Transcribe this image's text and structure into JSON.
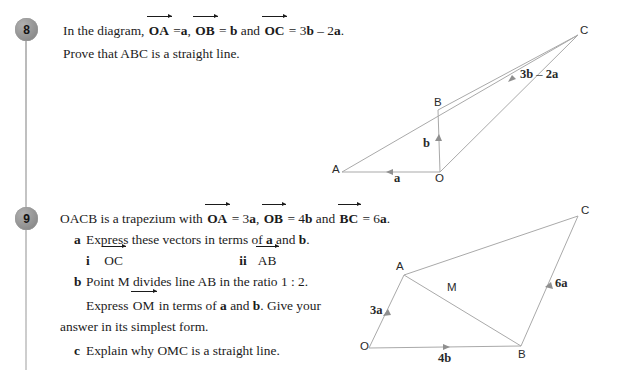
{
  "page": {
    "background": "#ffffff",
    "line_color": "#a9a9a9",
    "text_color": "#1b1b1b",
    "badge_color": "#8d8d8d"
  },
  "questions": [
    {
      "number": "8",
      "lines": [
        {
          "parts": [
            "In the diagram, ",
            "OA",
            " = ",
            "a",
            ", ",
            "OB",
            " = ",
            "b",
            " and ",
            "OC",
            " = 3",
            "b",
            " – 2",
            "a",
            "."
          ]
        },
        {
          "text": "Prove that ABC is a straight line."
        }
      ],
      "text": {
        "intro": "In the diagram,",
        "oa": "OA",
        "eq": "=",
        "a": "a",
        "comma": ",",
        "ob": "OB",
        "b": "b",
        "and": "and",
        "oc": "OC",
        "oc_value_1": "= 3",
        "oc_value_b": "b",
        "oc_value_minus": "– 2",
        "oc_value_a": "a",
        "period": ".",
        "prove": "Prove that ABC is a straight line."
      }
    },
    {
      "number": "9",
      "text": {
        "intro": "OACB is a trapezium with",
        "oa": "OA",
        "oa_value_num": "= 3",
        "oa_value_vec": "a",
        "comma": ",",
        "ob": "OB",
        "ob_value_num": "= 4",
        "ob_value_vec": "b",
        "and": "and",
        "bc": "BC",
        "bc_value_num": "= 6",
        "bc_value_vec": "a",
        "period": ".",
        "part_a_label": "a",
        "part_a": "Express these vectors in terms of a and b.",
        "part_a_pre": "Express these vectors in terms of",
        "part_a_mid": "and",
        "part_a_end": ".",
        "a_vec": "a",
        "b_vec": "b",
        "roman_i": "i",
        "item_i": "OC",
        "roman_ii": "ii",
        "item_ii": "AB",
        "part_b_label": "b",
        "part_b": "Point M divides line AB in the ratio 1 : 2.",
        "part_b_line2_pre": "Express",
        "part_b_om": "OM",
        "part_b_line2_mid": "in terms of",
        "part_b_line2_and": "and",
        "part_b_line2_tail": ". Give your",
        "part_b_line3": "answer in its simplest form.",
        "part_c_label": "c",
        "part_c": "Explain why OMC is a straight line."
      }
    }
  ],
  "diagram8": {
    "name": "vector-diagram-question-8",
    "points": {
      "A": "A",
      "O": "O",
      "B": "B",
      "C": "C"
    },
    "edge_labels": {
      "a": "a",
      "b": "b",
      "bc": "3b – 2a"
    },
    "bc_label_parts": {
      "three": "3",
      "b": "b",
      "minus": "–",
      "two": "2",
      "a": "a"
    }
  },
  "diagram9": {
    "name": "vector-diagram-question-9",
    "points": {
      "O": "O",
      "A": "A",
      "B": "B",
      "C": "C",
      "M": "M"
    },
    "edge_labels": {
      "oa": "3a",
      "ob": "4b",
      "bc": "6a"
    },
    "oa_parts": {
      "num": "3",
      "vec": "a"
    },
    "ob_parts": {
      "num": "4",
      "vec": "b"
    },
    "bc_parts": {
      "num": "6",
      "vec": "a"
    }
  }
}
